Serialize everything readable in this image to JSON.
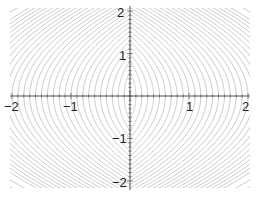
{
  "chart_data": {
    "type": "contour",
    "title": "",
    "xlabel": "",
    "ylabel": "",
    "xlim": [
      -2,
      2
    ],
    "ylim": [
      -2,
      2
    ],
    "grid": false,
    "legend": null,
    "x_ticks": [
      -2,
      -1,
      0,
      1,
      2
    ],
    "y_ticks": [
      -2,
      -1,
      0,
      1,
      2
    ],
    "x_tick_labels": [
      "−2",
      "−1",
      "1",
      "2"
    ],
    "y_tick_labels": [
      "2",
      "1",
      "−1",
      "−2"
    ],
    "contour_levels": [
      0.1,
      0.2,
      0.3,
      0.4,
      0.5,
      0.6,
      0.7,
      0.8,
      0.9,
      1.0,
      1.1,
      1.2,
      1.3,
      1.4,
      1.5,
      1.6,
      1.7,
      1.8,
      1.9,
      2.0,
      2.1,
      2.2,
      2.3,
      2.4,
      2.5,
      2.6,
      2.7,
      2.8,
      2.9,
      3.0,
      3.2,
      3.4,
      3.6,
      3.8,
      4.0
    ],
    "contour_description": "Nested lens-shaped level curves symmetric about both axes, elongated vertically near the origin and flattening into wide arcs further out",
    "line_color": "#bdbdbd",
    "axis_color": "#555555"
  },
  "axes": {
    "x_labels": [
      {
        "text": "−2",
        "value": -2
      },
      {
        "text": "−1",
        "value": -1
      },
      {
        "text": "1",
        "value": 1
      },
      {
        "text": "2",
        "value": 2
      }
    ],
    "y_labels": [
      {
        "text": "2",
        "value": 2
      },
      {
        "text": "1",
        "value": 1
      },
      {
        "text": "−1",
        "value": -1
      },
      {
        "text": "−2",
        "value": -2
      }
    ]
  }
}
